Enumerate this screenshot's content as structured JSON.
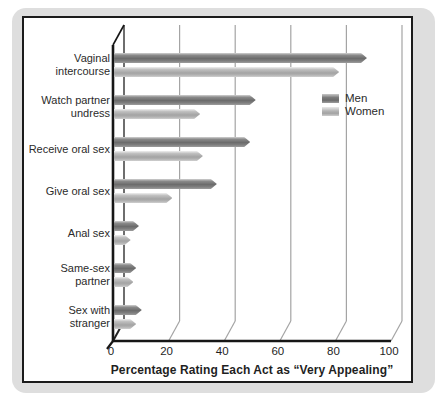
{
  "figure": {
    "type_note": "3D-effect horizontal grouped bar chart from a grayscale textbook figure"
  },
  "colors": {
    "card_bg": "#dedede",
    "panel_bg": "#ffffff",
    "panel_border": "#1b1b1b",
    "axis_line": "#161616",
    "grid_line": "#a4a4a4",
    "men_bar": "#6f6f6f",
    "women_bar": "#ababab",
    "text": "#2b2b2b"
  },
  "chart_data": {
    "type": "bar",
    "orientation": "horizontal",
    "title": "",
    "xlabel": "Percentage Rating Each Act as “Very Appealing”",
    "ylabel": "",
    "xlim": [
      0,
      100
    ],
    "x_ticks": [
      0,
      20,
      40,
      60,
      80,
      100
    ],
    "grid": true,
    "legend_position": "upper-right",
    "categories": [
      "Vaginal intercourse",
      "Watch partner undress",
      "Receive oral sex",
      "Give oral sex",
      "Anal sex",
      "Same-sex partner",
      "Sex with stranger"
    ],
    "category_lines": [
      [
        "Vaginal",
        "intercourse"
      ],
      [
        "Watch partner",
        "undress"
      ],
      [
        "Receive oral sex"
      ],
      [
        "Give oral sex"
      ],
      [
        "Anal sex"
      ],
      [
        "Same-sex",
        "partner"
      ],
      [
        "Sex with",
        "stranger"
      ]
    ],
    "series": [
      {
        "name": "Men",
        "values": [
          91,
          51,
          49,
          37,
          9,
          8,
          10
        ]
      },
      {
        "name": "Women",
        "values": [
          81,
          31,
          32,
          21,
          6,
          7,
          8
        ]
      }
    ]
  }
}
